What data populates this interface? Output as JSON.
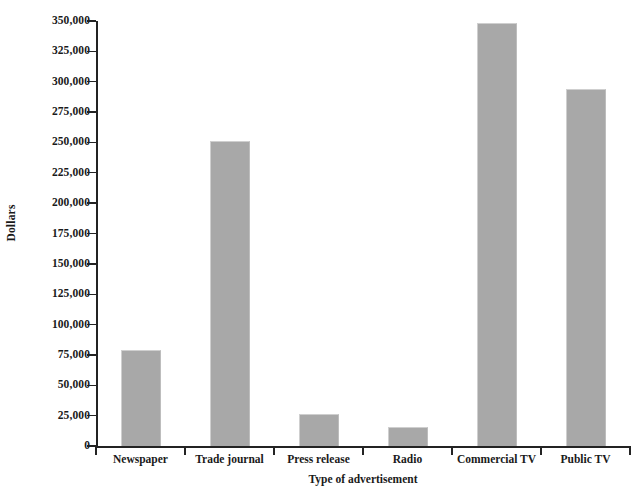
{
  "chart_data": {
    "type": "bar",
    "title": "",
    "xlabel": "Type of advertisement",
    "ylabel": "Dollars",
    "categories": [
      "Newspaper",
      "Trade journal",
      "Press release",
      "Radio",
      "Commercial TV",
      "Public TV"
    ],
    "values": [
      79000,
      251000,
      26000,
      16000,
      348000,
      294000
    ],
    "ylim": [
      0,
      350000
    ],
    "ytick_step": 25000,
    "ytick_labels": [
      "350,000",
      "325,000",
      "300,000",
      "275,000",
      "250,000",
      "225,000",
      "200,000",
      "175,000",
      "150,000",
      "125,000",
      "100,000",
      "75,000",
      "50,000",
      "25,000",
      "0"
    ],
    "ytick_values": [
      350000,
      325000,
      300000,
      275000,
      250000,
      225000,
      200000,
      175000,
      150000,
      125000,
      100000,
      75000,
      50000,
      25000,
      0
    ],
    "grid": false,
    "legend": null,
    "colors": {
      "bar_fill": "#a8a8a8",
      "axis": "#232323",
      "text": "#1a1a1a",
      "background": "#ffffff"
    }
  }
}
